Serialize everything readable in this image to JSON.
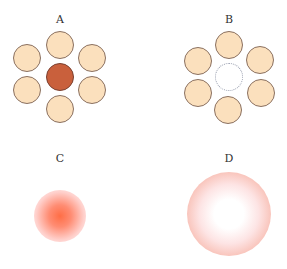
{
  "panels": [
    {
      "label": "A",
      "description": "six beads around a filled center"
    },
    {
      "label": "B",
      "description": "six beads around an empty center"
    },
    {
      "label": "C",
      "description": "small concentrated glow"
    },
    {
      "label": "D",
      "description": "large diffuse disc"
    }
  ],
  "colors": {
    "bead_fill": "#fbe0bd",
    "bead_outline": "#8a7060",
    "center_filled": "#c9603c",
    "glow_core": "#ff6e46",
    "disc_edge": "#f4aa9a"
  }
}
